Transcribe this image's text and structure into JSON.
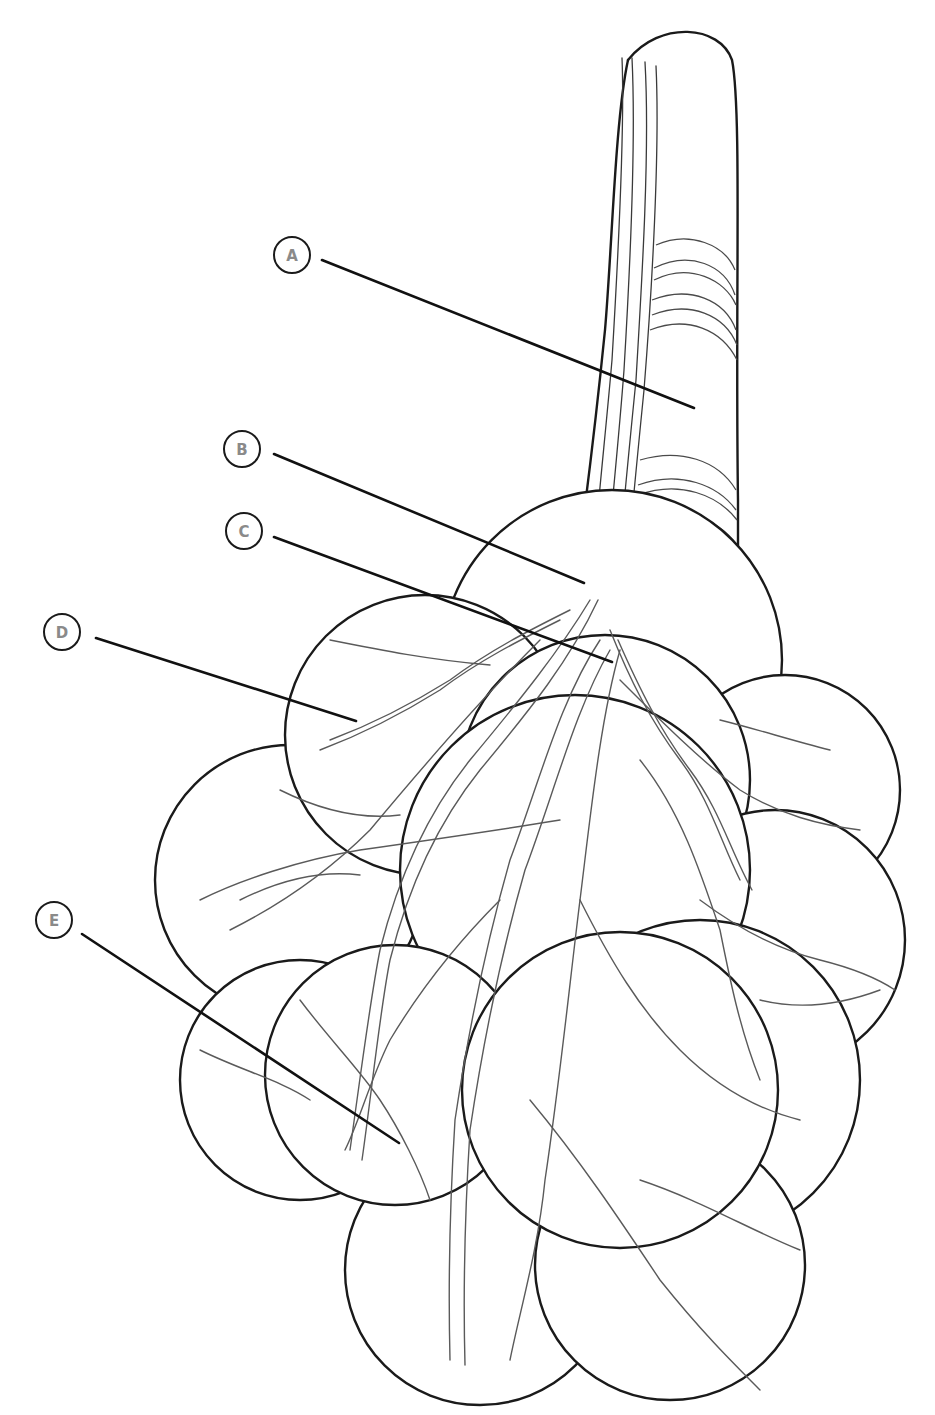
{
  "diagram": {
    "colors": {
      "outline": "#1a1a1a",
      "vessel": "#5a5a5a",
      "label_text": "#8a8a8a",
      "leader": "#111111",
      "background": "#ffffff"
    },
    "callouts": [
      {
        "letter": "A",
        "circle": [
          292,
          255
        ],
        "line_start": [
          322,
          260
        ],
        "line_end": [
          694,
          408
        ]
      },
      {
        "letter": "B",
        "circle": [
          242,
          449
        ],
        "line_start": [
          274,
          454
        ],
        "line_end": [
          584,
          583
        ]
      },
      {
        "letter": "C",
        "circle": [
          244,
          531
        ],
        "line_start": [
          274,
          537
        ],
        "line_end": [
          612,
          662
        ]
      },
      {
        "letter": "D",
        "circle": [
          62,
          632
        ],
        "line_start": [
          96,
          638
        ],
        "line_end": [
          356,
          721
        ]
      },
      {
        "letter": "E",
        "circle": [
          54,
          920
        ],
        "line_start": [
          82,
          934
        ],
        "line_end": [
          399,
          1143
        ]
      }
    ]
  }
}
